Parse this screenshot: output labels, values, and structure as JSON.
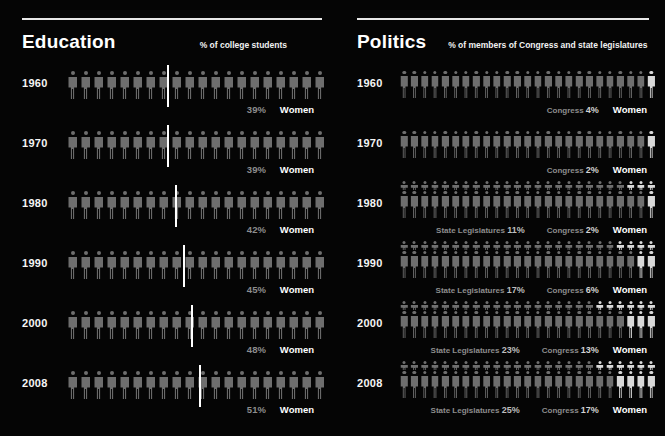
{
  "background_color": "#050505",
  "figure_color_dim": "#6e6e6e",
  "figure_color_highlight": "#d9d9d9",
  "marker_color": "#ffffff",
  "panels": {
    "education": {
      "title": "Education",
      "subtitle": "% of college students",
      "legend_label": "Women",
      "total_figures": 20,
      "rows": [
        {
          "year": "1960",
          "pct_label": "39%",
          "pct": 39
        },
        {
          "year": "1970",
          "pct_label": "39%",
          "pct": 39
        },
        {
          "year": "1980",
          "pct_label": "42%",
          "pct": 42
        },
        {
          "year": "1990",
          "pct_label": "45%",
          "pct": 45
        },
        {
          "year": "2000",
          "pct_label": "48%",
          "pct": 48
        },
        {
          "year": "2008",
          "pct_label": "51%",
          "pct": 51
        }
      ]
    },
    "politics": {
      "title": "Politics",
      "subtitle": "% of members of Congress and state legislatures",
      "legend_label": "Women",
      "congress_prefix": "Congress",
      "state_prefix": "State Legislatures",
      "total_figures": 25,
      "rows": [
        {
          "year": "1960",
          "congress_label": "Congress 4%",
          "congress_pct": 4,
          "congress_num": "4%",
          "state_label": "",
          "state_pct": null,
          "state_num": ""
        },
        {
          "year": "1970",
          "congress_label": "Congress 2%",
          "congress_pct": 2,
          "congress_num": "2%",
          "state_label": "",
          "state_pct": null,
          "state_num": ""
        },
        {
          "year": "1980",
          "congress_label": "Congress 2%",
          "congress_pct": 2,
          "congress_num": "2%",
          "state_label": "State Legislatures 11%",
          "state_pct": 11,
          "state_num": "11%"
        },
        {
          "year": "1990",
          "congress_label": "Congress 6%",
          "congress_pct": 6,
          "congress_num": "6%",
          "state_label": "State Legislatures 17%",
          "state_pct": 17,
          "state_num": "17%"
        },
        {
          "year": "2000",
          "congress_label": "Congress 13%",
          "congress_pct": 13,
          "congress_num": "13%",
          "state_label": "State Legislatures 23%",
          "state_pct": 23,
          "state_num": "23%"
        },
        {
          "year": "2008",
          "congress_label": "Congress 17%",
          "congress_pct": 17,
          "congress_num": "17%",
          "state_label": "State Legislatures 25%",
          "state_pct": 25,
          "state_num": "25%"
        }
      ]
    }
  },
  "chart_data": {
    "type": "bar",
    "charts": [
      {
        "name": "Education",
        "ylabel": "% of college students",
        "categories": [
          "1960",
          "1970",
          "1980",
          "1990",
          "2000",
          "2008"
        ],
        "values": [
          39,
          39,
          42,
          45,
          48,
          51
        ],
        "unit": "%",
        "ylim": [
          0,
          100
        ],
        "grid": false,
        "legend": [
          "Women"
        ]
      },
      {
        "name": "Politics",
        "ylabel": "% of members of Congress and state legislatures",
        "categories": [
          "1960",
          "1970",
          "1980",
          "1990",
          "2000",
          "2008"
        ],
        "series": [
          {
            "name": "Congress",
            "values": [
              4,
              2,
              2,
              6,
              13,
              17
            ]
          },
          {
            "name": "State Legislatures",
            "values": [
              null,
              null,
              11,
              17,
              23,
              25
            ]
          }
        ],
        "unit": "%",
        "ylim": [
          0,
          100
        ],
        "grid": false,
        "legend": [
          "Women"
        ]
      }
    ]
  }
}
